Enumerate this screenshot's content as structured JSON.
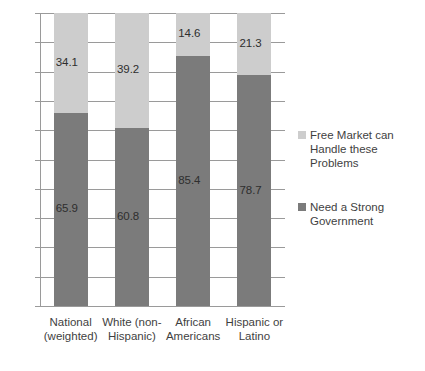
{
  "chart_data": {
    "type": "bar",
    "subtype": "stacked-100-percent",
    "title": "",
    "xlabel": "",
    "ylabel": "",
    "ylim": [
      0,
      100
    ],
    "ytick_labels": [
      "0%",
      "10%",
      "20%",
      "30%",
      "40%",
      "50%",
      "60%",
      "70%",
      "80%",
      "90%",
      "100%"
    ],
    "ytick_values": [
      0,
      10,
      20,
      30,
      40,
      50,
      60,
      70,
      80,
      90,
      100
    ],
    "grid": true,
    "legend_position": "right",
    "categories": [
      "National (weighted)",
      "White (non-Hispanic)",
      "African Americans",
      "Hispanic or Latino"
    ],
    "category_lines": [
      [
        "National",
        "(weighted)"
      ],
      [
        "White (non-",
        "Hispanic)"
      ],
      [
        "African",
        "Americans"
      ],
      [
        "Hispanic or",
        "Latino"
      ]
    ],
    "series": [
      {
        "name": "Need a Strong Government",
        "name_lines": [
          "Need a Strong",
          "Government"
        ],
        "color": "#7b7b7b",
        "values": [
          65.9,
          60.8,
          85.4,
          78.7
        ],
        "labels": [
          "65.9",
          "60.8",
          "85.4",
          "78.7"
        ]
      },
      {
        "name": "Free Market can Handle these Problems",
        "name_lines": [
          "Free Market can",
          "Handle these Problems"
        ],
        "color": "#cdcdcd",
        "values": [
          34.1,
          39.2,
          14.6,
          21.3
        ],
        "labels": [
          "34.1",
          "39.2",
          "14.6",
          "21.3"
        ]
      }
    ]
  },
  "colors": {
    "light_gray": "#cdcdcd",
    "dark_gray": "#7b7b7b",
    "gridline": "#9a9a9a",
    "text": "#3f3f3f",
    "background": "#ffffff"
  },
  "bottom_caption": ""
}
